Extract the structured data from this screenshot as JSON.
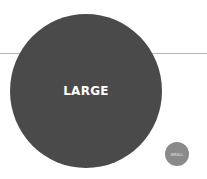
{
  "diagram": {
    "baseline": {
      "color": "#b5b5b5"
    },
    "circles": [
      {
        "label": "LARGE",
        "color": "#4a4a4a"
      },
      {
        "label": "SMALL",
        "color": "#8a8a8a"
      }
    ]
  }
}
